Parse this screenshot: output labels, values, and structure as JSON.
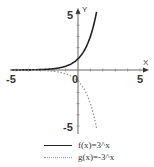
{
  "chart_data": {
    "type": "line",
    "title": "",
    "xlabel": "X",
    "ylabel": "Y",
    "xlim": [
      -5.5,
      5.5
    ],
    "ylim": [
      -5.5,
      5.5
    ],
    "x_ticks": [
      -5,
      -4,
      -3,
      -2,
      -1,
      0,
      1,
      2,
      3,
      4,
      5
    ],
    "y_ticks": [
      -5,
      -4,
      -3,
      -2,
      -1,
      0,
      1,
      2,
      3,
      4,
      5
    ],
    "x_tick_labels": [
      "-5",
      "0",
      "5"
    ],
    "y_tick_labels": [
      "5",
      "-5"
    ],
    "grid": false,
    "legend_position": "bottom",
    "series": [
      {
        "name": "f(x)=3^x",
        "style": "solid",
        "color": "#222222",
        "x": [
          -5,
          -4,
          -3,
          -2,
          -1,
          0,
          0.5,
          1,
          1.5
        ],
        "values": [
          0.004,
          0.012,
          0.037,
          0.111,
          0.333,
          1,
          1.732,
          3,
          5.196
        ]
      },
      {
        "name": "g(x)=-3^x",
        "style": "dotted",
        "color": "#9a9a9a",
        "x": [
          -5,
          -4,
          -3,
          -2,
          -1,
          0,
          0.5,
          1,
          1.5
        ],
        "values": [
          -0.004,
          -0.012,
          -0.037,
          -0.111,
          -0.333,
          -1,
          -1.732,
          -3,
          -5.196
        ]
      }
    ]
  },
  "labels": {
    "x_axis_name": "X",
    "y_axis_name": "Y",
    "x_min": "-5",
    "x_origin": "0",
    "x_max": "5",
    "y_max": "5",
    "y_min": "-5"
  },
  "legend": {
    "f_label": "f(x)=3^x",
    "g_label": "g(x)=-3^x"
  }
}
